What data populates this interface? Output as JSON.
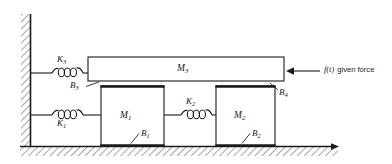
{
  "diagram": {
    "type": "mechanical-schematic",
    "canvas": {
      "width": 392,
      "height": 164
    },
    "background_color": "#ffffff",
    "line_color": "#1a1a1a",
    "hatch_color": "#555555"
  },
  "supports": {
    "wall": {
      "name": "fixed-wall",
      "orientation": "vertical",
      "hatching_side": "left",
      "x": 30,
      "y_top": 14,
      "y_bottom": 147
    },
    "ground": {
      "name": "fixed-ground",
      "orientation": "horizontal",
      "hatching_side": "below",
      "y": 147,
      "x_left": 20,
      "x_right": 338,
      "arrow_at_right": true
    }
  },
  "masses": [
    {
      "id": "M3",
      "label": "M",
      "subscript": "3",
      "shape": "beam",
      "x": 88,
      "y": 57,
      "width": 196,
      "height": 24,
      "label_x": 182,
      "label_y": 65
    },
    {
      "id": "M1",
      "label": "M",
      "subscript": "1",
      "shape": "block",
      "x": 101,
      "y": 86,
      "width": 63,
      "height": 60,
      "label_x": 124,
      "label_y": 112
    },
    {
      "id": "M2",
      "label": "M",
      "subscript": "2",
      "shape": "block",
      "x": 216,
      "y": 86,
      "width": 59,
      "height": 60,
      "label_x": 238,
      "label_y": 112
    }
  ],
  "springs": [
    {
      "id": "K3",
      "label": "K",
      "subscript": "3",
      "connects_from": "fixed-wall",
      "connects_to": "M3",
      "y": 73,
      "x_start": 31,
      "x_end": 88,
      "label_x": 52,
      "label_y": 60,
      "label_position": "above"
    },
    {
      "id": "K1",
      "label": "K",
      "subscript": "1",
      "connects_from": "fixed-wall",
      "connects_to": "M1",
      "y": 115,
      "x_start": 31,
      "x_end": 101,
      "label_x": 52,
      "label_y": 122,
      "label_position": "below"
    },
    {
      "id": "K2",
      "label": "K",
      "subscript": "2",
      "connects_from": "M1",
      "connects_to": "M2",
      "y": 115,
      "x_start": 164,
      "x_end": 216,
      "label_x": 181,
      "label_y": 102,
      "label_position": "above"
    }
  ],
  "dampers": [
    {
      "id": "B3",
      "label": "B",
      "subscript": "3",
      "interface": "M3-bottom-to-M1-top",
      "label_x": 71,
      "label_y": 85,
      "leader_from_x": 86,
      "leader_from_y": 86,
      "leader_to_x": 101,
      "leader_to_y": 82
    },
    {
      "id": "B4",
      "label": "B",
      "subscript": "4",
      "interface": "M3-bottom-to-M2-top",
      "label_x": 278,
      "label_y": 92,
      "leader_from_x": 277,
      "leader_from_y": 90,
      "leader_to_x": 268,
      "leader_to_y": 82
    },
    {
      "id": "B1",
      "label": "B",
      "subscript": "1",
      "interface": "M1-bottom-to-ground",
      "label_x": 140,
      "label_y": 134,
      "leader_from_x": 139,
      "leader_from_y": 133,
      "leader_to_x": 130,
      "leader_to_y": 144
    },
    {
      "id": "B2",
      "label": "B",
      "subscript": "2",
      "interface": "M2-bottom-to-ground",
      "label_x": 251,
      "label_y": 134,
      "leader_from_x": 250,
      "leader_from_y": 133,
      "leader_to_x": 241,
      "leader_to_y": 144
    }
  ],
  "force": {
    "id": "f_t",
    "symbol": "f(t)",
    "description": "given force",
    "full_label": "f(t) given force",
    "direction": "leftward",
    "applied_to": "M3",
    "arrow_tip_x": 287,
    "arrow_tail_x": 320,
    "arrow_y": 71,
    "label_x": 324,
    "label_y": 68
  }
}
